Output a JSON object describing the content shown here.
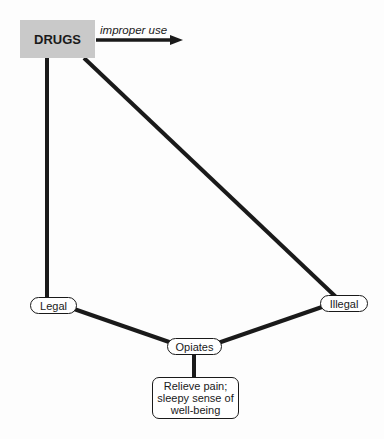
{
  "diagram": {
    "root": {
      "label": "DRUGS",
      "fill": "#c9c9c9"
    },
    "arrow": {
      "label": "improper use"
    },
    "nodes": {
      "legal": "Legal",
      "illegal": "Illegal",
      "opiates": "Opiates",
      "effect": "Relieve pain; sleepy sense of well-being"
    },
    "edges": [
      {
        "from": "DRUGS",
        "to": "Legal"
      },
      {
        "from": "DRUGS",
        "to": "Illegal"
      },
      {
        "from": "Legal",
        "to": "Opiates"
      },
      {
        "from": "Illegal",
        "to": "Opiates"
      },
      {
        "from": "Opiates",
        "to": "Relieve pain; sleepy sense of well-being"
      },
      {
        "from": "DRUGS",
        "to": "improper use",
        "type": "arrow"
      }
    ],
    "line_color": "#1a1a1a"
  }
}
